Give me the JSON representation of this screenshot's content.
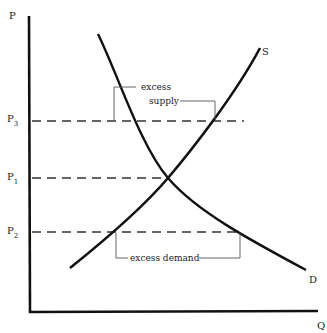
{
  "diagram": {
    "title": "",
    "type": "supply-demand",
    "axes": {
      "y_label": "P",
      "x_label": "Q"
    },
    "price_levels": [
      {
        "id": "P3",
        "base": "P",
        "sub": "3"
      },
      {
        "id": "P1",
        "base": "P",
        "sub": "1"
      },
      {
        "id": "P2",
        "base": "P",
        "sub": "2"
      }
    ],
    "curves": {
      "supply_label": "S",
      "demand_label": "D"
    },
    "annotations": {
      "excess_supply_line1": "excess",
      "excess_supply_line2": "supply",
      "excess_demand": "excess demand"
    },
    "colors": {
      "curve": "#111111",
      "dashed": "#333333",
      "bracket": "#555555"
    }
  }
}
